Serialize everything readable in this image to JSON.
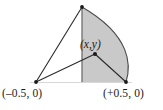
{
  "figure": {
    "background_color": "#ffffff",
    "stroke_color": "#2b2b2b",
    "fill_color": "#c9c9c9",
    "fill_color_light": "#d4d4d4",
    "labels": {
      "left_vertex": "(–0.5, 0)",
      "right_vertex": "(+0.5, 0)",
      "interior_point": "(x,y)"
    },
    "points": [
      {
        "name": "apex",
        "x": 82,
        "y": 7,
        "marker": "dot"
      },
      {
        "name": "left-vertex",
        "x": 36,
        "y": 82,
        "marker": "dot"
      },
      {
        "name": "right-vertex",
        "x": 126,
        "y": 82,
        "marker": "dot"
      },
      {
        "name": "interior-point",
        "x": 95,
        "y": 54,
        "marker": "dot"
      }
    ],
    "segments": [
      {
        "name": "left-vertex-to-apex",
        "from": "left-vertex",
        "to": "apex"
      },
      {
        "name": "left-vertex-to-interior-point",
        "from": "left-vertex",
        "to": "interior-point"
      },
      {
        "name": "interior-point-to-right-vertex",
        "from": "interior-point",
        "to": "right-vertex"
      },
      {
        "name": "vertical-axis",
        "from": "apex",
        "to": "base-midpoint"
      },
      {
        "name": "baseline",
        "from": "left-vertex",
        "to": "right-vertex"
      }
    ],
    "arc": {
      "name": "right-arc",
      "from": "apex",
      "to": "right-vertex",
      "bulge_x": 133
    },
    "shaded_region": {
      "name": "shaded-segment",
      "description": "region bounded by vertical axis, arc, and baseline"
    }
  }
}
